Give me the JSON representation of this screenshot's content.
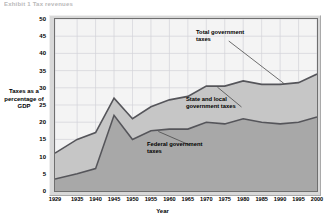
{
  "headline": "Exhibit 1  Tax revenues",
  "axes": {
    "y_label": "Taxes as a percentage of GDP",
    "x_label": "Year",
    "y_ticks": [
      "50",
      "45",
      "40",
      "35",
      "30",
      "25",
      "20",
      "15",
      "10",
      "5",
      "0"
    ],
    "x_ticks": [
      "1929",
      "1935",
      "1940",
      "1945",
      "1950",
      "1955",
      "1960",
      "1965",
      "1970",
      "1975",
      "1980",
      "1985",
      "1990",
      "1995",
      "2000"
    ]
  },
  "annotations": {
    "total": "Total government taxes",
    "state_local": "State and local government taxes",
    "federal": "Federal government taxes"
  },
  "colors": {
    "federal_band": "#a8a8a8",
    "state_band": "#c6c6c6",
    "plot_background": "#f4f4f4",
    "frame": "#d8d8d8",
    "line": "#55555a",
    "gridline": "#d3d3d8",
    "axis": "#6f6f6f"
  },
  "chart_data": {
    "type": "area",
    "title": "Exhibit 1  Tax revenues",
    "xlabel": "Year",
    "ylabel": "Taxes as a percentage of GDP",
    "ylim": [
      0,
      50
    ],
    "xlim": [
      1929,
      2000
    ],
    "grid": true,
    "stacked": true,
    "legend": "annotations-inline",
    "x": [
      1929,
      1935,
      1940,
      1945,
      1950,
      1955,
      1960,
      1965,
      1970,
      1975,
      1980,
      1985,
      1990,
      1995,
      2000
    ],
    "series": [
      {
        "name": "Federal government taxes",
        "values": [
          3.5,
          5.0,
          6.5,
          22.0,
          15.0,
          17.5,
          18.0,
          18.0,
          20.0,
          19.5,
          21.0,
          20.0,
          19.5,
          20.0,
          21.5
        ]
      },
      {
        "name": "State and local government taxes",
        "values": [
          7.5,
          10.0,
          10.5,
          5.0,
          6.0,
          7.0,
          8.5,
          9.5,
          10.5,
          11.0,
          11.0,
          11.0,
          11.5,
          11.5,
          12.5
        ]
      }
    ],
    "totals": {
      "name": "Total government taxes",
      "values": [
        11.0,
        15.0,
        17.0,
        27.0,
        21.0,
        24.5,
        26.5,
        27.5,
        30.5,
        30.5,
        32.0,
        31.0,
        31.0,
        31.5,
        34.0
      ]
    }
  }
}
